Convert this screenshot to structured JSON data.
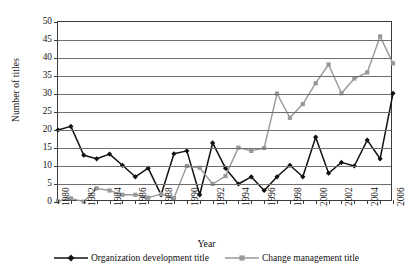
{
  "chart_data": {
    "type": "line",
    "title": "",
    "xlabel": "Year",
    "ylabel": "Number of titles",
    "xlim": [
      1980,
      2006
    ],
    "ylim": [
      0,
      50
    ],
    "yticks": [
      0,
      5,
      10,
      15,
      20,
      25,
      30,
      35,
      40,
      45,
      50
    ],
    "xticks": [
      1980,
      1982,
      1984,
      1986,
      1988,
      1990,
      1992,
      1994,
      1996,
      1998,
      2000,
      2002,
      2004,
      2006
    ],
    "grid": "horizontal",
    "legend_position": "bottom",
    "x": [
      1980,
      1981,
      1982,
      1983,
      1984,
      1985,
      1986,
      1987,
      1988,
      1989,
      1990,
      1991,
      1992,
      1993,
      1994,
      1995,
      1996,
      1997,
      1998,
      1999,
      2000,
      2001,
      2002,
      2003,
      2004,
      2005,
      2006
    ],
    "series": [
      {
        "name": "Organization development title",
        "color": "#111111",
        "marker": "diamond",
        "values": [
          20,
          21,
          13,
          12,
          13.3,
          10.2,
          7,
          9.4,
          2,
          13.4,
          14.2,
          2,
          16.4,
          9.4,
          5,
          7,
          3.2,
          7,
          10.2,
          7,
          18,
          8,
          11,
          10,
          17.2,
          12,
          30.2
        ]
      },
      {
        "name": "Change management title",
        "color": "#999999",
        "marker": "square",
        "values": [
          0.2,
          1,
          0.1,
          3.8,
          3.2,
          2,
          2,
          1.2,
          2.2,
          1.1,
          10,
          9.5,
          5,
          7.2,
          15.1,
          14.2,
          15,
          30.1,
          23.4,
          27.2,
          33,
          38.2,
          30.2,
          34.3,
          36,
          46,
          38.5
        ]
      }
    ]
  },
  "axes": {
    "y_title": "Number of titles",
    "x_title": "Year"
  },
  "legend": {
    "entries": [
      {
        "label": "Organization development title",
        "color": "#111111",
        "marker": "diamond"
      },
      {
        "label": "Change management title",
        "color": "#999999",
        "marker": "square"
      }
    ]
  }
}
